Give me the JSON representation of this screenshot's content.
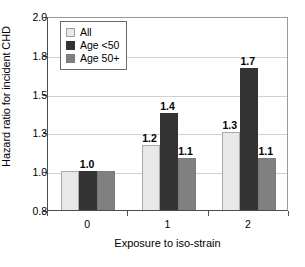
{
  "chart_data": {
    "type": "bar",
    "title": "",
    "subtitle": "",
    "xlabel": "Exposure to iso-strain",
    "ylabel": "Hazard ratio for incident CHD",
    "categories": [
      "0",
      "1",
      "2"
    ],
    "series": [
      {
        "name": "All",
        "values": [
          1.0,
          1.2,
          1.3
        ],
        "color": "#e8e8e8"
      },
      {
        "name": "Age <50",
        "values": [
          1.0,
          1.4,
          1.7
        ],
        "color": "#333333"
      },
      {
        "name": "Age 50+",
        "values": [
          1.0,
          1.1,
          1.1
        ],
        "color": "#808080"
      }
    ],
    "data_labels": [
      [
        "1.0",
        "",
        ""
      ],
      [
        "1.2",
        "1.4",
        "1.1"
      ],
      [
        "1.3",
        "1.7",
        "1.1"
      ]
    ],
    "ytick_labels": [
      "2.0",
      "1.8",
      "1.5",
      "1.3",
      "1.0",
      "0.8"
    ],
    "ytick_values": [
      2.0,
      1.8,
      1.5,
      1.3,
      1.0,
      0.8
    ],
    "ylim": [
      0.8,
      2.0
    ],
    "grid": true,
    "legend_position": "top-left",
    "legend_entries": [
      "All",
      "Age <50",
      "Age 50+"
    ]
  }
}
